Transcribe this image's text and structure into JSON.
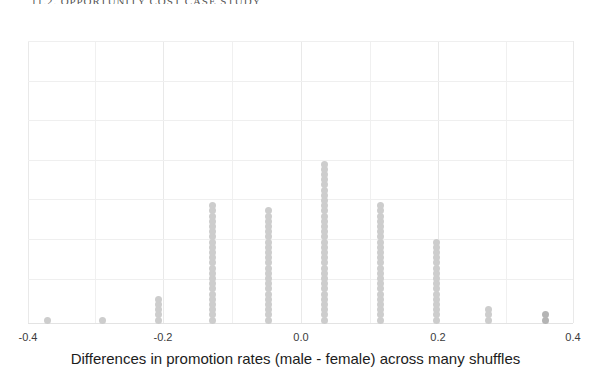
{
  "page": {
    "section_heading": "11.2.  OPPORTUNITY COST CASE STUDY"
  },
  "chart_data": {
    "type": "dotplot",
    "title": "",
    "xlabel": "Differences in promotion rates (male - female) across many shuffles",
    "ylabel": "",
    "xlim": [
      -0.44,
      0.435
    ],
    "xticks": [
      -0.4,
      -0.2,
      0.0,
      0.2,
      0.4
    ],
    "xtick_labels": [
      "-0.4",
      "-0.2",
      "0.0",
      "0.2",
      "0.4"
    ],
    "grid": true,
    "legend": "none",
    "dot_color": "#cdcdcd",
    "grid_color": "#efefef",
    "x": [
      -0.37,
      -0.29,
      -0.21,
      -0.13,
      -0.045,
      0.035,
      0.12,
      0.2,
      0.28,
      0.37
    ],
    "counts": [
      1,
      1,
      5,
      23,
      22,
      31,
      23,
      16,
      3,
      2
    ],
    "dot_pixel_x": [
      47,
      102,
      158,
      212,
      268,
      324,
      380,
      436,
      488,
      545
    ],
    "dot_dark_flags": [
      false,
      false,
      false,
      false,
      false,
      false,
      false,
      false,
      false,
      true
    ],
    "total_points": 127
  },
  "gridlines": {
    "vertical_major_px": [
      28,
      163,
      301,
      438,
      573
    ],
    "vertical_minor_px": [
      95,
      232,
      370,
      506
    ],
    "horizontal_px": [
      41,
      81,
      120,
      160,
      199,
      239,
      279
    ],
    "axis_px": 323
  }
}
